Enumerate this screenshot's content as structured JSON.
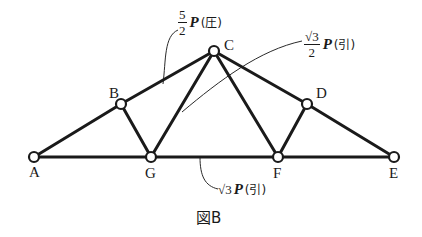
{
  "figure": {
    "caption": "図B",
    "nodes": [
      {
        "id": "A",
        "label": "A",
        "x": 34,
        "y": 157
      },
      {
        "id": "B",
        "label": "B",
        "x": 121,
        "y": 104
      },
      {
        "id": "C",
        "label": "C",
        "x": 214,
        "y": 51
      },
      {
        "id": "D",
        "label": "D",
        "x": 307,
        "y": 104
      },
      {
        "id": "E",
        "label": "E",
        "x": 394,
        "y": 157
      },
      {
        "id": "F",
        "label": "F",
        "x": 278,
        "y": 157
      },
      {
        "id": "G",
        "label": "G",
        "x": 151,
        "y": 157
      }
    ],
    "members": [
      "A-B",
      "B-C",
      "C-D",
      "D-E",
      "A-G",
      "G-F",
      "F-E",
      "B-G",
      "G-C",
      "C-F",
      "F-D"
    ],
    "forces": [
      {
        "member": "B-C",
        "coef_num": "5",
        "coef_den": "2",
        "symbol": "P",
        "kind": "(圧)"
      },
      {
        "member": "G-C",
        "coef_num": "√3",
        "coef_den": "2",
        "symbol": "P",
        "kind": "(引)"
      },
      {
        "member": "G-F",
        "coef": "√3",
        "symbol": "P",
        "kind": "(引)"
      }
    ]
  }
}
